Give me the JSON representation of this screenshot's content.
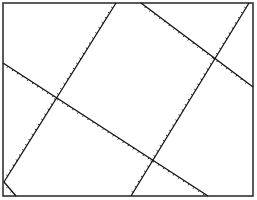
{
  "diagram": {
    "frame": {
      "x": 3,
      "y": 3,
      "width": 250,
      "height": 193,
      "color": "#333333"
    },
    "line_color": "#111111",
    "tick_color": "#222222",
    "lines": [
      {
        "name": "fault-line-1",
        "x1": 116,
        "y1": 3,
        "x2": 4,
        "y2": 182
      },
      {
        "name": "fault-line-2",
        "x1": 3,
        "y1": 63,
        "x2": 208,
        "y2": 196
      },
      {
        "name": "fault-line-3",
        "x1": 141,
        "y1": 3,
        "x2": 253,
        "y2": 87
      },
      {
        "name": "fault-line-4",
        "x1": 249,
        "y1": 3,
        "x2": 131,
        "y2": 196
      },
      {
        "name": "corner-line",
        "x1": 4,
        "y1": 182,
        "x2": 16,
        "y2": 196
      }
    ]
  }
}
